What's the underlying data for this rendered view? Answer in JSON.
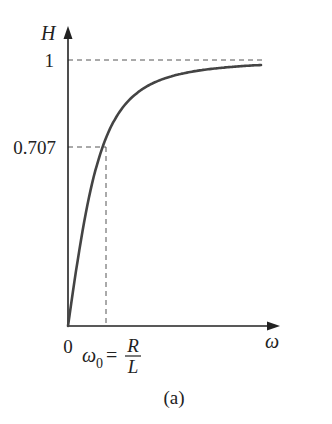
{
  "chart_data": {
    "type": "line",
    "title": "",
    "caption": "(a)",
    "xlabel": "ω",
    "ylabel": "H",
    "x_ticks": [
      {
        "value": 0,
        "label": "0"
      },
      {
        "value": 1,
        "label_main": "ω",
        "label_sub": "0",
        "label_eq": "=",
        "label_num": "R",
        "label_den": "L"
      }
    ],
    "y_ticks": [
      {
        "value": 0.707,
        "label": "0.707"
      },
      {
        "value": 1,
        "label": "1"
      }
    ],
    "x_units": "multiples of ω0 = R/L",
    "xlim": [
      0,
      5.1
    ],
    "ylim": [
      0,
      1
    ],
    "grid": false,
    "reference_lines": [
      {
        "type": "horizontal",
        "y": 1,
        "style": "dashed"
      },
      {
        "type": "horizontal",
        "y": 0.707,
        "x_end": 1,
        "style": "dashed"
      },
      {
        "type": "vertical",
        "x": 1,
        "y_end": 0.707,
        "style": "dashed"
      }
    ],
    "series": [
      {
        "name": "H(ω) = ω / sqrt(ω² + ω0²)",
        "x": [
          0,
          0.25,
          0.5,
          0.75,
          1,
          1.5,
          2,
          2.5,
          3,
          3.5,
          4,
          4.5,
          5.08
        ],
        "values": [
          0,
          0.243,
          0.447,
          0.6,
          0.707,
          0.832,
          0.894,
          0.928,
          0.949,
          0.962,
          0.97,
          0.976,
          0.981
        ]
      }
    ]
  },
  "labels": {
    "y_axis": "H",
    "x_axis": "ω",
    "y_tick_1": "1",
    "y_tick_0707": "0.707",
    "x_origin": "0",
    "omega0_main": "ω",
    "omega0_sub": "0",
    "omega0_eq": "=",
    "omega0_num": "R",
    "omega0_den": "L",
    "caption": "(a)"
  },
  "colors": {
    "axis": "#222222",
    "curve": "#444444",
    "dashed": "#555555",
    "text": "#222222"
  }
}
